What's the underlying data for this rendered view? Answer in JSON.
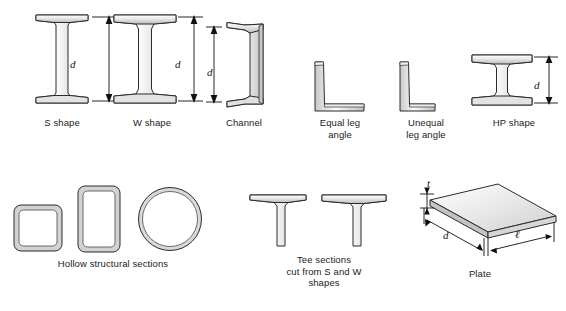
{
  "figure": {
    "background_color": "#ffffff",
    "outline_color": "#2b2b2b",
    "fill_light": "#fbfbfb",
    "fill_mid": "#d9d9d9",
    "fill_shadow": "#b4b4b4",
    "text_color": "#1b1b1b"
  },
  "row1": {
    "shapes": [
      {
        "id": "s-shape",
        "caption": "S shape",
        "dimension_label": "d",
        "has_dimension": true,
        "description": "I-beam with narrow tapered flanges"
      },
      {
        "id": "w-shape",
        "caption": "W shape",
        "dimension_label": "d",
        "has_dimension": true,
        "description": "Wide flange I-beam"
      },
      {
        "id": "channel",
        "caption": "Channel",
        "dimension_label": "d",
        "has_dimension": true,
        "description": "C-shaped channel with vertical web"
      },
      {
        "id": "equal-leg-angle",
        "caption": "Equal leg\nangle",
        "dimension_label": "",
        "has_dimension": false,
        "description": "L-shaped angle with equal legs"
      },
      {
        "id": "unequal-leg-angle",
        "caption": "Unequal\nleg angle",
        "dimension_label": "",
        "has_dimension": false,
        "description": "L-shaped angle with unequal legs"
      },
      {
        "id": "hp-shape",
        "caption": "HP shape",
        "dimension_label": "d",
        "has_dimension": true,
        "description": "Bearing pile H shape"
      }
    ]
  },
  "row2": {
    "groups": [
      {
        "id": "hollow-structural-sections",
        "caption": "Hollow structural sections",
        "members": [
          "square-hss",
          "rectangular-hss",
          "round-hss"
        ]
      },
      {
        "id": "tee-sections",
        "caption": "Tee sections\ncut from S and W\nshapes",
        "members": [
          "tee-from-s",
          "tee-from-w"
        ]
      },
      {
        "id": "plate",
        "caption": "Plate",
        "members": [
          "plate-slab"
        ],
        "dimensions": {
          "thickness_label": "t",
          "depth_label": "d",
          "length_label": "ℓ"
        }
      }
    ]
  }
}
